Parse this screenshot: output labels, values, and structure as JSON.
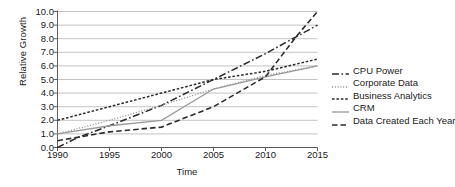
{
  "chart_data": {
    "type": "line",
    "title": "",
    "xlabel": "Time",
    "ylabel": "Relative Growth",
    "xlim": [
      1990,
      2015
    ],
    "ylim": [
      0.0,
      10.0
    ],
    "grid": true,
    "legend_position": "right",
    "x_ticks": [
      "1990",
      "1995",
      "2000",
      "2005",
      "2010",
      "2015"
    ],
    "x_tick_values": [
      1990,
      1995,
      2000,
      2005,
      2010,
      2015
    ],
    "y_ticks": [
      "0.0",
      "1.0",
      "2.0",
      "3.0",
      "4.0",
      "5.0",
      "6.0",
      "7.0",
      "8.0",
      "9.0",
      "10.0"
    ],
    "y_tick_values": [
      0,
      1,
      2,
      3,
      4,
      5,
      6,
      7,
      8,
      9,
      10
    ],
    "x": [
      1990,
      1995,
      2000,
      2005,
      2010,
      2015
    ],
    "series": [
      {
        "name": "CPU Power",
        "style": "dash-dot",
        "color": "#2b2b2b",
        "dasharray": "7,2.5,1.6,2.5",
        "width": 1.5,
        "points": [
          {
            "x": 1990,
            "y": 0.0
          },
          {
            "x": 1992,
            "y": 0.75
          },
          {
            "x": 1995,
            "y": 1.6
          },
          {
            "x": 2000,
            "y": 3.1
          },
          {
            "x": 2005,
            "y": 5.0
          },
          {
            "x": 2010,
            "y": 6.9
          },
          {
            "x": 2015,
            "y": 9.0
          }
        ]
      },
      {
        "name": "Corporate Data",
        "style": "dotted",
        "color": "#8c8c8c",
        "dasharray": "1,1.8",
        "width": 1.3,
        "points": [
          {
            "x": 1990,
            "y": 1.0
          },
          {
            "x": 1995,
            "y": 2.0
          },
          {
            "x": 2000,
            "y": 3.1
          },
          {
            "x": 2005,
            "y": 4.3
          },
          {
            "x": 2010,
            "y": 5.3
          },
          {
            "x": 2015,
            "y": 6.0
          }
        ]
      },
      {
        "name": "Business Analytics",
        "style": "short-dash",
        "color": "#2b2b2b",
        "dasharray": "2.6,1.8",
        "width": 1.5,
        "points": [
          {
            "x": 1990,
            "y": 2.0
          },
          {
            "x": 1995,
            "y": 3.0
          },
          {
            "x": 2000,
            "y": 4.0
          },
          {
            "x": 2005,
            "y": 5.0
          },
          {
            "x": 2010,
            "y": 5.6
          },
          {
            "x": 2015,
            "y": 6.5
          }
        ]
      },
      {
        "name": "CRM",
        "style": "solid",
        "color": "#9a9a9a",
        "dasharray": "",
        "width": 1.3,
        "points": [
          {
            "x": 1990,
            "y": 1.0
          },
          {
            "x": 1995,
            "y": 1.6
          },
          {
            "x": 2000,
            "y": 2.0
          },
          {
            "x": 2005,
            "y": 4.3
          },
          {
            "x": 2010,
            "y": 5.2
          },
          {
            "x": 2015,
            "y": 6.0
          }
        ]
      },
      {
        "name": "Data Created Each Year",
        "style": "long-dash",
        "color": "#2b2b2b",
        "dasharray": "5.5,3",
        "width": 1.6,
        "points": [
          {
            "x": 1990,
            "y": 0.5
          },
          {
            "x": 1995,
            "y": 1.15
          },
          {
            "x": 2000,
            "y": 1.5
          },
          {
            "x": 2005,
            "y": 3.0
          },
          {
            "x": 2010,
            "y": 5.2
          },
          {
            "x": 2013,
            "y": 8.2
          },
          {
            "x": 2015,
            "y": 10.0
          }
        ]
      }
    ]
  }
}
